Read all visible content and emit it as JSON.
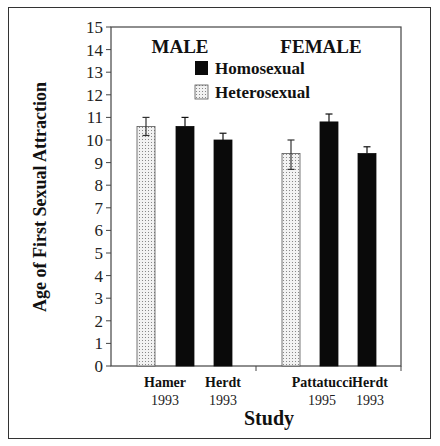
{
  "chart_data": {
    "type": "bar",
    "title": "",
    "xlabel": "Study",
    "ylabel": "Age of First Sexual Attraction",
    "ylim": [
      0,
      15
    ],
    "yticks": [
      0,
      1,
      2,
      3,
      4,
      5,
      6,
      7,
      8,
      9,
      10,
      11,
      12,
      13,
      14,
      15
    ],
    "grid": false,
    "legend_position": "top-center, inside plot",
    "group_labels": [
      "MALE",
      "FEMALE"
    ],
    "categories": [
      "Hamer 1993",
      "Herdt 1993",
      "Pattatucci 1995",
      "Herdt 1993"
    ],
    "category_labels": [
      {
        "line1": "Hamer",
        "line2": "1993"
      },
      {
        "line1": "Herdt",
        "line2": "1993"
      },
      {
        "line1": "Pattatucci",
        "line2": "1995"
      },
      {
        "line1": "Herdt",
        "line2": "1993"
      }
    ],
    "series": [
      {
        "name": "Homosexual",
        "fill": "#0a0a0a",
        "pattern": "solid"
      },
      {
        "name": "Heterosexual",
        "fill": "#e8e8e8",
        "pattern": "dotted"
      }
    ],
    "bars": [
      {
        "group": "MALE",
        "study": "Hamer 1993",
        "series": "Heterosexual",
        "value": 10.6,
        "err_high": 11.0,
        "err_low": 10.2
      },
      {
        "group": "MALE",
        "study": "Hamer 1993",
        "series": "Homosexual",
        "value": 10.6,
        "err_high": 11.0,
        "err_low": null
      },
      {
        "group": "MALE",
        "study": "Herdt 1993",
        "series": "Homosexual",
        "value": 10.0,
        "err_high": 10.3,
        "err_low": null
      },
      {
        "group": "FEMALE",
        "study": "Pattatucci 1995",
        "series": "Heterosexual",
        "value": 9.4,
        "err_high": 10.0,
        "err_low": 8.7
      },
      {
        "group": "FEMALE",
        "study": "Pattatucci 1995",
        "series": "Homosexual",
        "value": 10.8,
        "err_high": 11.15,
        "err_low": null
      },
      {
        "group": "FEMALE",
        "study": "Herdt 1993",
        "series": "Homosexual",
        "value": 9.4,
        "err_high": 9.7,
        "err_low": null
      }
    ]
  },
  "labels": {
    "ylabel": "Age of First Sexual Attraction",
    "xlabel": "Study",
    "group_male": "MALE",
    "group_female": "FEMALE",
    "legend_homo": "Homosexual",
    "legend_hetero": "Heterosexual"
  }
}
